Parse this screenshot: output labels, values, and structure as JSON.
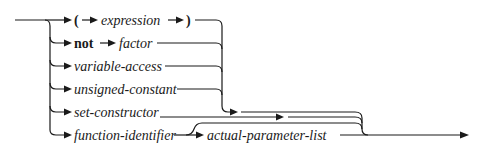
{
  "diagram": {
    "type": "syntax-diagram",
    "subject": "factor",
    "alternatives": [
      {
        "id": "paren",
        "tokens": [
          {
            "text": "(",
            "kind": "symbol"
          },
          {
            "text": "expression",
            "kind": "nonterminal"
          },
          {
            "text": ")",
            "kind": "symbol"
          }
        ]
      },
      {
        "id": "not",
        "tokens": [
          {
            "text": "not",
            "kind": "keyword"
          },
          {
            "text": "factor",
            "kind": "nonterminal"
          }
        ]
      },
      {
        "id": "variable",
        "tokens": [
          {
            "text": "variable-access",
            "kind": "nonterminal"
          }
        ]
      },
      {
        "id": "constant",
        "tokens": [
          {
            "text": "unsigned-constant",
            "kind": "nonterminal"
          }
        ]
      },
      {
        "id": "set",
        "tokens": [
          {
            "text": "set-constructor",
            "kind": "nonterminal"
          }
        ]
      },
      {
        "id": "function",
        "tokens": [
          {
            "text": "function-identifier",
            "kind": "nonterminal"
          },
          {
            "text": "actual-parameter-list",
            "kind": "nonterminal",
            "optional": true
          }
        ]
      }
    ],
    "labels": {
      "open_paren": "(",
      "expression": "expression",
      "close_paren": ")",
      "not": "not",
      "factor": "factor",
      "variable_access": "variable-access",
      "unsigned_constant": "unsigned-constant",
      "set_constructor": "set-constructor",
      "function_identifier": "function-identifier",
      "actual_parameter_list": "actual-parameter-list"
    },
    "line_color": "#1a1a1a"
  }
}
